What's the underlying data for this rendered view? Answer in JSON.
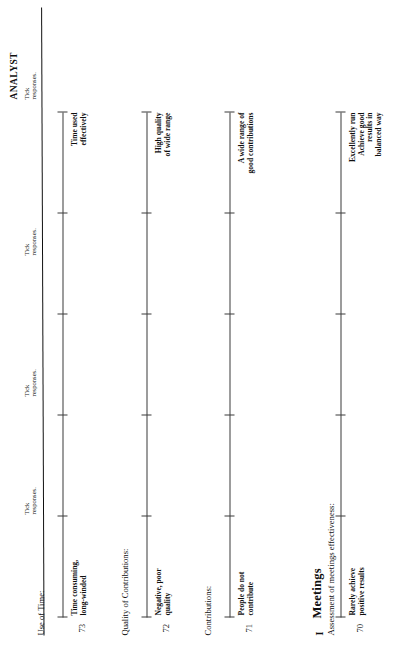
{
  "document": {
    "analyst_header": "ANALYST",
    "tick_note_line1": "Tick",
    "tick_note_line2": "responses.",
    "section_number": "I",
    "section_title": "Meetings"
  },
  "items": [
    {
      "number": "70",
      "prompt": "Assessment of meetings effectiveness:",
      "low_anchor": [
        "Rarely achieve",
        "positive results"
      ],
      "high_anchor": [
        "Excellently run",
        "Achieve good",
        "results in",
        "balanced way"
      ],
      "tick_note_line1": "Tick",
      "tick_note_line2": "responses."
    },
    {
      "number": "71",
      "prompt": "Contributions:",
      "low_anchor": [
        "People do not",
        "contribute"
      ],
      "high_anchor": [
        "A wide range of",
        "good contributions"
      ],
      "tick_note_line1": "Tick",
      "tick_note_line2": "responses."
    },
    {
      "number": "72",
      "prompt": "Quality of Contributions:",
      "low_anchor": [
        "Negative, poor",
        "quality"
      ],
      "high_anchor": [
        "High quality",
        "of wide range"
      ],
      "tick_note_line1": "Tick",
      "tick_note_line2": "responses."
    },
    {
      "number": "73",
      "prompt": "Use of Time:",
      "low_anchor": [
        "Time consuming,",
        "long-winded"
      ],
      "high_anchor": [
        "Time used",
        "effectively"
      ],
      "tick_note_line1": "Tick",
      "tick_note_line2": "responses."
    }
  ],
  "scale": {
    "tick_count": 6,
    "tick_positions_pct": [
      0,
      20,
      40,
      60,
      80,
      100
    ]
  },
  "colors": {
    "ink": "#0f0f0f",
    "rule": "#3a3a3a",
    "paper": "#ffffff"
  }
}
